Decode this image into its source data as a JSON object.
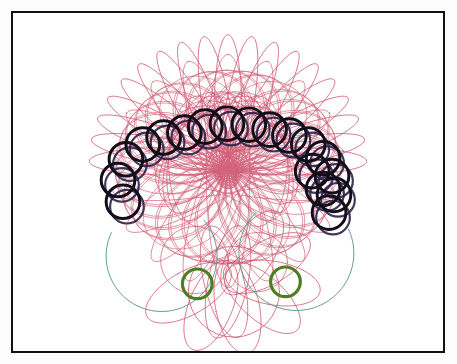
{
  "canvas": {
    "width": 457,
    "height": 364,
    "background": "#ffffff"
  },
  "frame": {
    "label": "picture-frame",
    "border_color": "#111111",
    "border_width_px": 2.5,
    "x": 11,
    "y": 11,
    "width": 434,
    "height": 342,
    "fill": "#ffffff"
  },
  "artwork": {
    "title": "Spirograph Rosette",
    "medium": "pen on paper",
    "description": "Abstract spirograph drawing: a crimson epitrochoid rosette crowned by an arc of black circles, with two teal arcs and two olive-green circles below",
    "palette": {
      "crimson": "#cf5771",
      "crimson_light": "#d9798d",
      "black": "#120d18",
      "navy": "#2b2147",
      "teal": "#5f9a95",
      "green": "#4f7d1f",
      "paper": "#ffffff"
    },
    "layers": [
      {
        "name": "crimson-rosette",
        "color": "#cf5771",
        "stroke": 0.9
      },
      {
        "name": "teal-arcs",
        "color": "#5f9a95",
        "stroke": 1.0
      },
      {
        "name": "black-circle-chain",
        "color": "#120d18",
        "stroke": 3.0
      },
      {
        "name": "green-circles",
        "color": "#4f7d1f",
        "stroke": 3.0
      }
    ]
  },
  "chart_data": {
    "type": "scatter",
    "xlabel": "",
    "ylabel": "",
    "xlim": [
      0,
      434
    ],
    "ylim": [
      0,
      342
    ],
    "grid": false,
    "legend": "none",
    "series": [
      {
        "name": "crimson-rosette",
        "color": "#cf5771",
        "kind": "epitrochoid",
        "params": {
          "cx": 217,
          "cy": 150,
          "R": 96,
          "r": 15.5,
          "d": 78,
          "petals": 19,
          "turns": 19,
          "stroke": 0.9
        }
      },
      {
        "name": "crimson-rosette-inner",
        "color": "#d2637b",
        "kind": "hypotrochoid",
        "params": {
          "cx": 217,
          "cy": 152,
          "R": 78,
          "r": 13,
          "d": 62,
          "petals": 13,
          "turns": 13,
          "stroke": 0.8
        }
      },
      {
        "name": "crimson-lower-flower",
        "color": "#cf5771",
        "kind": "rose-petals",
        "params": {
          "cx": 217,
          "cy": 268,
          "petal_len": 78,
          "petal_w": 22,
          "count": 6,
          "rotation": 20,
          "stroke": 0.9
        }
      },
      {
        "name": "teal-arc-left",
        "color": "#5f9a95",
        "kind": "circle-arc",
        "params": {
          "cx": 150,
          "cy": 246,
          "r": 56,
          "start_deg": -40,
          "end_deg": 205,
          "stroke": 1.0
        }
      },
      {
        "name": "teal-arc-right",
        "color": "#5f9a95",
        "kind": "circle-arc",
        "params": {
          "cx": 286,
          "cy": 243,
          "r": 58,
          "start_deg": -25,
          "end_deg": 225,
          "stroke": 1.0
        }
      },
      {
        "name": "black-circle-chain",
        "color": "#120d18",
        "kind": "circle-chain",
        "stroke": 3.0,
        "radius": 17,
        "count": 18,
        "points": [
          [
            111,
            191
          ],
          [
            106,
            169
          ],
          [
            114,
            148
          ],
          [
            131,
            133
          ],
          [
            152,
            126
          ],
          [
            173,
            121
          ],
          [
            194,
            115
          ],
          [
            216,
            112
          ],
          [
            238,
            113
          ],
          [
            259,
            118
          ],
          [
            279,
            124
          ],
          [
            298,
            133
          ],
          [
            313,
            147
          ],
          [
            322,
            165
          ],
          [
            324,
            184
          ],
          [
            319,
            202
          ],
          [
            313,
            178
          ],
          [
            302,
            160
          ]
        ]
      },
      {
        "name": "navy-underlay-chain",
        "color": "#2b2147",
        "kind": "circle-chain",
        "stroke": 2.2,
        "radius": 17,
        "count": 18,
        "offset": [
          4,
          5
        ]
      },
      {
        "name": "green-circles",
        "color": "#4f7d1f",
        "kind": "circles",
        "stroke": 3.2,
        "radius": 15,
        "points": [
          [
            186,
            274
          ],
          [
            275,
            272
          ]
        ]
      }
    ]
  }
}
